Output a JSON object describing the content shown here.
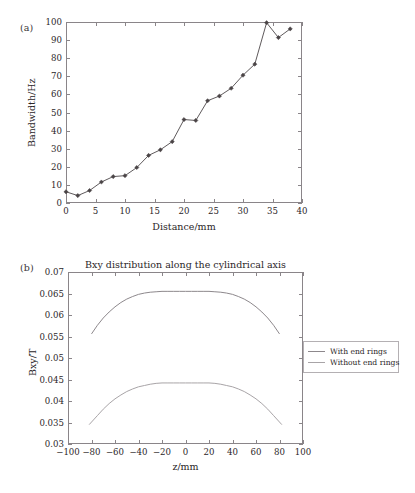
{
  "figure": {
    "panel_a_tag": "(a)",
    "panel_b_tag": "(b)"
  },
  "chart_data": [
    {
      "type": "line",
      "panel": "(a)",
      "title": "",
      "xlabel": "Distance/mm",
      "ylabel": "Bandwidth/Hz",
      "xlim": [
        0,
        40
      ],
      "ylim": [
        0,
        100
      ],
      "xticks": [
        0,
        5,
        10,
        15,
        20,
        25,
        30,
        35,
        40
      ],
      "yticks": [
        0,
        10,
        20,
        30,
        40,
        50,
        60,
        70,
        80,
        90,
        100
      ],
      "xtick_labels": [
        "0",
        "5",
        "10",
        "15",
        "20",
        "25",
        "30",
        "35",
        "40"
      ],
      "ytick_labels": [
        "0",
        "10",
        "20",
        "30",
        "40",
        "50",
        "60",
        "70",
        "80",
        "90",
        "100"
      ],
      "grid": false,
      "legend": "none",
      "marker": "diamond",
      "line_color": "#4d4749",
      "x": [
        0,
        2,
        4,
        6,
        8,
        10,
        12,
        14,
        16,
        18,
        20,
        22,
        24,
        26,
        28,
        30,
        32,
        34,
        36,
        38
      ],
      "values": [
        6.2,
        4.1,
        6.9,
        11.6,
        14.6,
        15.1,
        19.6,
        26.3,
        29.4,
        33.9,
        46.1,
        45.6,
        56.5,
        59.1,
        63.4,
        70.6,
        76.7,
        99.6,
        91.4,
        96.2
      ]
    },
    {
      "type": "line",
      "panel": "(b)",
      "title": "Bxy distribution along the cylindrical axis",
      "xlabel": "z/mm",
      "ylabel": "Bxy/T",
      "xlim": [
        -100,
        100
      ],
      "ylim": [
        0.03,
        0.07
      ],
      "xticks": [
        -100,
        -80,
        -60,
        -40,
        -20,
        0,
        20,
        40,
        60,
        80,
        100
      ],
      "yticks": [
        0.03,
        0.035,
        0.04,
        0.045,
        0.05,
        0.055,
        0.06,
        0.065,
        0.07
      ],
      "xtick_labels": [
        "−100",
        "−80",
        "−60",
        "−40",
        "−20",
        "0",
        "20",
        "40",
        "60",
        "80",
        "100"
      ],
      "ytick_labels": [
        "0.03",
        "0.035",
        "0.04",
        "0.045",
        "0.05",
        "0.055",
        "0.06",
        "0.065",
        "0.07"
      ],
      "grid": false,
      "legend": "outside-right",
      "series": [
        {
          "name": "With end rings",
          "color": "#8d888c",
          "x": [
            -80,
            -75,
            -70,
            -65,
            -60,
            -55,
            -50,
            -45,
            -40,
            -35,
            -30,
            -25,
            -20,
            -15,
            -10,
            -5,
            0,
            5,
            10,
            15,
            20,
            25,
            30,
            35,
            40,
            45,
            50,
            55,
            60,
            65,
            70,
            75,
            80
          ],
          "values": [
            0.0556,
            0.0576,
            0.0593,
            0.0607,
            0.0619,
            0.0629,
            0.0637,
            0.0643,
            0.0648,
            0.0651,
            0.0653,
            0.0654,
            0.0655,
            0.0655,
            0.0655,
            0.0655,
            0.0655,
            0.0655,
            0.0655,
            0.0655,
            0.0655,
            0.0654,
            0.0653,
            0.0651,
            0.0648,
            0.0643,
            0.0637,
            0.0629,
            0.0619,
            0.0607,
            0.0593,
            0.0576,
            0.0556
          ]
        },
        {
          "name": "Without end rings",
          "color": "#a8a4a7",
          "x": [
            -82,
            -75,
            -70,
            -65,
            -60,
            -55,
            -50,
            -45,
            -40,
            -35,
            -30,
            -25,
            -20,
            -15,
            -10,
            -5,
            0,
            5,
            10,
            15,
            20,
            25,
            30,
            35,
            40,
            45,
            50,
            55,
            60,
            65,
            70,
            75,
            82
          ],
          "values": [
            0.0345,
            0.0366,
            0.0381,
            0.0394,
            0.0405,
            0.0414,
            0.0422,
            0.0428,
            0.0433,
            0.0436,
            0.0439,
            0.0441,
            0.0442,
            0.0442,
            0.0442,
            0.0442,
            0.0442,
            0.0442,
            0.0442,
            0.0442,
            0.0442,
            0.0441,
            0.0439,
            0.0436,
            0.0433,
            0.0428,
            0.0422,
            0.0414,
            0.0405,
            0.0394,
            0.0381,
            0.0366,
            0.0345
          ]
        }
      ]
    }
  ],
  "legend": {
    "items": [
      {
        "label": "With end rings",
        "color": "#8d888c"
      },
      {
        "label": "Without end rings",
        "color": "#a8a4a7"
      }
    ]
  }
}
